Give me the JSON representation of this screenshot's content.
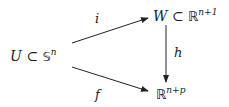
{
  "diagram": {
    "type": "commutative-diagram",
    "nodes": {
      "U": {
        "var": "U",
        "rel": "⊂",
        "space": "𝕊",
        "exp": "n"
      },
      "W": {
        "var": "W",
        "rel": "⊂",
        "space": "ℝ",
        "exp": "n+1"
      },
      "R": {
        "space": "ℝ",
        "exp": "n+p"
      }
    },
    "arrows": [
      {
        "id": "i",
        "label": "i",
        "from": "U",
        "to": "W"
      },
      {
        "id": "h",
        "label": "h",
        "from": "W",
        "to": "R"
      },
      {
        "id": "f",
        "label": "f",
        "from": "U",
        "to": "R"
      }
    ],
    "color": "#222222"
  }
}
